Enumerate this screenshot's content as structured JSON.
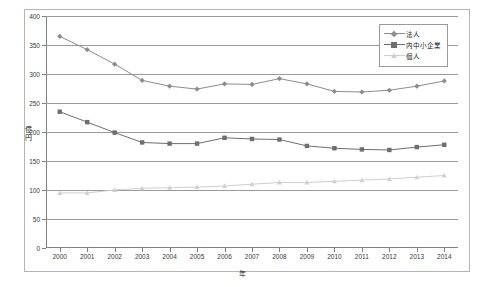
{
  "top_cut_text": "",
  "axis": {
    "y_title": "億円",
    "x_title": "年",
    "y_ticks": [
      0,
      50,
      100,
      150,
      200,
      250,
      300,
      350,
      400
    ],
    "x_ticks": [
      "2000",
      "2001",
      "2002",
      "2003",
      "2004",
      "2005",
      "2006",
      "2007",
      "2008",
      "2009",
      "2010",
      "2011",
      "2012",
      "2013",
      "2014"
    ]
  },
  "legend": {
    "position": "top-right",
    "items": [
      {
        "label": "法人",
        "marker": "diamond",
        "color": "#8c8c8c"
      },
      {
        "label": "内中小企業",
        "marker": "square",
        "color": "#6e6e6e"
      },
      {
        "label": "個人",
        "marker": "triangle",
        "color": "#cfcfcf"
      }
    ]
  },
  "chart_data": {
    "type": "line",
    "title": "",
    "xlabel": "年",
    "ylabel": "億円",
    "ylim": [
      0,
      400
    ],
    "ytick_step": 50,
    "grid": true,
    "legend_position": "top-right",
    "categories": [
      "2000",
      "2001",
      "2002",
      "2003",
      "2004",
      "2005",
      "2006",
      "2007",
      "2008",
      "2009",
      "2010",
      "2011",
      "2012",
      "2013",
      "2014"
    ],
    "series": [
      {
        "name": "法人",
        "marker": "diamond",
        "color": "#8c8c8c",
        "values": [
          365,
          342,
          317,
          289,
          279,
          274,
          283,
          282,
          292,
          283,
          270,
          269,
          272,
          279,
          288
        ]
      },
      {
        "name": "内中小企業",
        "marker": "square",
        "color": "#6e6e6e",
        "values": [
          235,
          217,
          199,
          182,
          180,
          180,
          190,
          188,
          187,
          176,
          172,
          170,
          169,
          174,
          178
        ]
      },
      {
        "name": "個人",
        "marker": "triangle",
        "color": "#cfcfcf",
        "values": [
          95,
          95,
          100,
          103,
          104,
          105,
          107,
          110,
          113,
          113,
          115,
          117,
          119,
          122,
          125
        ]
      }
    ]
  }
}
